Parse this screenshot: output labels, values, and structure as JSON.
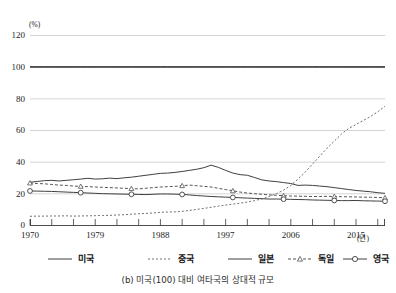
{
  "figure": {
    "caption": "(b) 미국(100) 대비 여타국의 상대적 규모",
    "unit_label": "(%)",
    "x_unit_label": "(년)"
  },
  "axis": {
    "y_ticks": [
      "0",
      "20",
      "40",
      "60",
      "80",
      "100",
      "120"
    ],
    "x_ticks": [
      "1970",
      "1979",
      "1988",
      "1997",
      "2006",
      "2015"
    ]
  },
  "legend": {
    "items": [
      {
        "label": "미국",
        "style": "solid",
        "marker": "none"
      },
      {
        "label": "중국",
        "style": "dotted",
        "marker": "none"
      },
      {
        "label": "일본",
        "style": "solid",
        "marker": "none"
      },
      {
        "label": "독일",
        "style": "dashed",
        "marker": "triangle"
      },
      {
        "label": "영국",
        "style": "solid",
        "marker": "circle"
      }
    ]
  },
  "chart_data": {
    "type": "line",
    "title": "(b) 미국(100) 대비 여타국의 상대적 규모",
    "xlabel": "(년)",
    "ylabel": "(%)",
    "xlim": [
      1970,
      2019
    ],
    "ylim": [
      0,
      120
    ],
    "yticks": [
      0,
      20,
      40,
      60,
      80,
      100,
      120
    ],
    "xticks": [
      1970,
      1979,
      1988,
      1997,
      2006,
      2015
    ],
    "grid": true,
    "legend_position": "bottom",
    "x": [
      1970,
      1971,
      1972,
      1973,
      1974,
      1975,
      1976,
      1977,
      1978,
      1979,
      1980,
      1981,
      1982,
      1983,
      1984,
      1985,
      1986,
      1987,
      1988,
      1989,
      1990,
      1991,
      1992,
      1993,
      1994,
      1995,
      1996,
      1997,
      1998,
      1999,
      2000,
      2001,
      2002,
      2003,
      2004,
      2005,
      2006,
      2007,
      2008,
      2009,
      2010,
      2011,
      2012,
      2013,
      2014,
      2015,
      2016,
      2017,
      2018,
      2019
    ],
    "series": [
      {
        "name": "미국",
        "style": "solid",
        "marker": "none",
        "values": [
          100,
          100,
          100,
          100,
          100,
          100,
          100,
          100,
          100,
          100,
          100,
          100,
          100,
          100,
          100,
          100,
          100,
          100,
          100,
          100,
          100,
          100,
          100,
          100,
          100,
          100,
          100,
          100,
          100,
          100,
          100,
          100,
          100,
          100,
          100,
          100,
          100,
          100,
          100,
          100,
          100,
          100,
          100,
          100,
          100,
          100,
          100,
          100,
          100,
          100
        ]
      },
      {
        "name": "중국",
        "style": "dotted",
        "marker": "none",
        "values": [
          5.5,
          5.6,
          5.6,
          5.7,
          5.7,
          5.8,
          5.6,
          5.7,
          5.8,
          5.9,
          6.0,
          6.1,
          6.3,
          6.5,
          6.8,
          7.1,
          7.3,
          7.6,
          8.0,
          8.2,
          8.3,
          8.6,
          9.2,
          9.8,
          10.5,
          11.2,
          11.9,
          12.6,
          13.2,
          13.8,
          14.5,
          15.4,
          16.5,
          18.0,
          19.8,
          22.0,
          25.0,
          29.0,
          33.5,
          38.5,
          43.5,
          48.5,
          53.0,
          57.5,
          61.0,
          63.5,
          66.0,
          68.5,
          71.5,
          75.0
        ]
      },
      {
        "name": "일본",
        "style": "solid",
        "marker": "none",
        "values": [
          27.0,
          27.5,
          28.0,
          28.2,
          27.8,
          28.2,
          28.6,
          29.0,
          29.5,
          29.0,
          29.2,
          29.6,
          29.3,
          29.8,
          30.2,
          30.8,
          31.4,
          32.0,
          32.6,
          32.8,
          33.2,
          33.8,
          34.5,
          35.2,
          36.2,
          37.8,
          36.4,
          34.5,
          32.8,
          31.8,
          31.4,
          30.0,
          28.5,
          27.8,
          27.4,
          26.8,
          26.2,
          25.0,
          25.2,
          25.0,
          24.6,
          24.2,
          23.6,
          23.0,
          22.4,
          21.8,
          21.4,
          21.0,
          20.4,
          20.0
        ]
      },
      {
        "name": "독일",
        "style": "dashed",
        "marker": "triangle",
        "values": [
          26.5,
          26.2,
          26.0,
          25.6,
          25.2,
          25.0,
          24.6,
          24.4,
          24.2,
          24.0,
          23.8,
          23.6,
          23.4,
          23.2,
          23.0,
          22.8,
          23.2,
          23.6,
          24.0,
          24.2,
          24.4,
          24.8,
          25.2,
          24.8,
          24.4,
          24.0,
          23.2,
          22.4,
          21.6,
          20.8,
          20.2,
          19.8,
          19.4,
          19.0,
          18.8,
          18.5,
          18.3,
          18.2,
          18.1,
          18.0,
          18.0,
          18.1,
          18.0,
          17.9,
          17.8,
          17.7,
          17.6,
          17.5,
          17.4,
          17.2
        ]
      },
      {
        "name": "영국",
        "style": "solid",
        "marker": "circle",
        "values": [
          21.5,
          21.4,
          21.3,
          21.2,
          21.0,
          20.8,
          20.6,
          20.4,
          20.2,
          20.0,
          19.8,
          19.7,
          19.6,
          19.5,
          19.4,
          19.3,
          19.2,
          19.4,
          19.6,
          19.6,
          19.5,
          19.3,
          19.0,
          18.6,
          18.3,
          18.0,
          17.8,
          17.6,
          17.4,
          17.2,
          17.0,
          16.8,
          16.6,
          16.4,
          16.4,
          16.3,
          16.2,
          16.1,
          16.0,
          15.8,
          15.7,
          15.6,
          15.5,
          15.4,
          15.4,
          15.5,
          15.3,
          15.2,
          15.1,
          15.0
        ]
      }
    ]
  }
}
